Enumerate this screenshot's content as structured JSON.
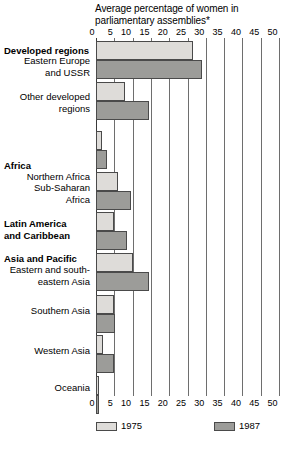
{
  "chart_data": {
    "type": "bar",
    "orientation": "horizontal",
    "title": "Average percentage of women in parliamentary assemblies*",
    "title_line1": "Average percentage of women in",
    "title_line2": "parliamentary assemblies*",
    "xlabel": "",
    "ylabel": "",
    "xlim": [
      0,
      50
    ],
    "xticks": [
      0,
      5,
      10,
      15,
      20,
      25,
      30,
      35,
      40,
      45,
      50
    ],
    "xtick_labels": [
      "0",
      "5",
      "10",
      "15",
      "20",
      "25",
      "30",
      "35",
      "40",
      "45",
      "50"
    ],
    "grid": true,
    "legend_position": "bottom",
    "categories": [
      "Eastern Europe and USSR",
      "Other developed regions",
      "Northern Africa",
      "Sub-Saharan Africa",
      "Latin America and Caribbean",
      "Eastern and south-eastern Asia",
      "Southern Asia",
      "Western Asia",
      "Oceania"
    ],
    "series": [
      {
        "name": "1975",
        "color": "#dedcd9",
        "values": [
          26.5,
          8.0,
          1.7,
          6.0,
          5.0,
          10.0,
          5.0,
          2.0,
          0.7
        ]
      },
      {
        "name": "1987",
        "color": "#9c9c99",
        "values": [
          29.0,
          14.5,
          3.0,
          9.5,
          8.5,
          14.5,
          5.2,
          5.0,
          0.7
        ]
      }
    ]
  },
  "groups": [
    {
      "heading": "Developed regions",
      "rows": [
        {
          "label_line1": "Eastern Europe",
          "label_line2": "and USSR",
          "v1975": 26.5,
          "v1987": 29.0
        },
        {
          "label_line1": "Other developed",
          "label_line2": "regions",
          "v1975": 8.0,
          "v1987": 14.5
        }
      ]
    },
    {
      "heading": "Africa",
      "rows": [
        {
          "label_line1": "Northern Africa",
          "label_line2": "",
          "v1975": 1.7,
          "v1987": 3.0
        },
        {
          "label_line1": "Sub-Saharan",
          "label_line2": "Africa",
          "v1975": 6.0,
          "v1987": 9.5
        }
      ]
    },
    {
      "heading": "Latin America and Caribbean",
      "heading_line1": "Latin America",
      "heading_line2": "and Caribbean",
      "rows": [
        {
          "label_line1": "",
          "label_line2": "",
          "v1975": 5.0,
          "v1987": 8.5
        }
      ]
    },
    {
      "heading": "Asia and Pacific",
      "rows": [
        {
          "label_line1": "Eastern and south-",
          "label_line2": "eastern Asia",
          "v1975": 10.0,
          "v1987": 14.5
        },
        {
          "label_line1": "Southern Asia",
          "label_line2": "",
          "v1975": 5.0,
          "v1987": 5.2
        },
        {
          "label_line1": "Western Asia",
          "label_line2": "",
          "v1975": 2.0,
          "v1987": 5.0
        },
        {
          "label_line1": "Oceania",
          "label_line2": "",
          "v1975": 0.7,
          "v1987": 0.7
        }
      ]
    }
  ],
  "legend": {
    "items": [
      {
        "label": "1975",
        "color": "#dedcd9"
      },
      {
        "label": "1987",
        "color": "#9c9c99"
      }
    ]
  },
  "colors": {
    "series_1975": "#dedcd9",
    "series_1987": "#9c9c99",
    "gridline": "#6e6e6e",
    "bar_border": "#4a4a4a",
    "background": "#ffffff"
  }
}
